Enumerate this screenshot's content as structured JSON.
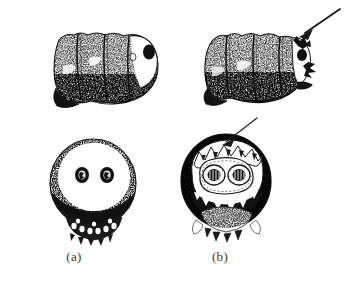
{
  "figure": {
    "background_color": "#ffffff",
    "ink_color": "#1a1a1a",
    "label_color": "#3a3a3a",
    "panels": [
      {
        "id": "a",
        "label": "(a)",
        "lateral_view": {
          "name": "larva-lateral-uninfected",
          "description": "lateral view of segmented larval abdomen, stippled halftone texture, pale head region at right with single dark ocellar spot",
          "segments": 4,
          "has_arrow": false
        },
        "terminal_view": {
          "name": "larva-terminal-uninfected",
          "description": "terminal/posterior view, rounded ovoid body with pale upper field containing two small dark spiracular spots, dark shaded lower band and fringed spinous margin at base",
          "spot_count": 2,
          "has_arrow": false
        }
      },
      {
        "id": "b",
        "label": "(b)",
        "lateral_view": {
          "name": "larva-lateral-affected",
          "description": "lateral view of segmented larval abdomen, stippled halftone texture, damaged/irregular eroded margin at right indicated by arrow",
          "segments": 4,
          "has_arrow": true
        },
        "terminal_view": {
          "name": "larva-terminal-affected",
          "description": "terminal/posterior view, rounded body with pale central field enclosing two ringed spiracular structures, heavy dark lateral shading, irregular crested upper margin indicated by arrow, toothed band and spinous base",
          "spot_count": 2,
          "has_arrow": true
        }
      }
    ],
    "annotations": [
      {
        "name": "arrow-lateral-b",
        "style": "solid-shaft-filled-head",
        "points_to": "eroded dorsal margin of lateral specimen (b)",
        "direction": "upper-right to lower-left"
      },
      {
        "name": "arrow-terminal-b",
        "style": "thin-shaft-open-head",
        "points_to": "irregular crested upper margin of terminal specimen (b)",
        "direction": "upper-right to lower-left"
      }
    ]
  }
}
